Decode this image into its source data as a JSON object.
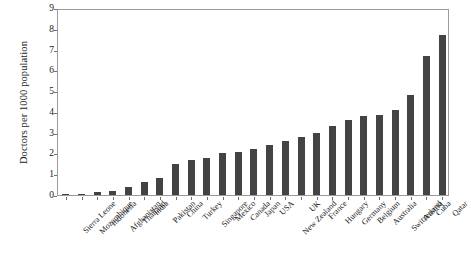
{
  "chart_data": {
    "type": "bar",
    "title": "",
    "xlabel": "",
    "ylabel": "Doctors per 1000 population",
    "ylim": [
      0,
      9
    ],
    "yticks": [
      0,
      1,
      2,
      3,
      4,
      5,
      6,
      7,
      8,
      9
    ],
    "ytick_labels": [
      "0",
      "1",
      "2",
      "3",
      "4",
      "5",
      "6",
      "7",
      "8",
      "9"
    ],
    "grid": false,
    "legend": false,
    "bar_color": "#434343",
    "axis_color": "#9a9a9a",
    "categories": [
      "Sierra Leone",
      "Mozambique",
      "Indonesia",
      "Afghanistan",
      "Thailand",
      "India",
      "Pakistan",
      "China",
      "Turkey",
      "Singapore",
      "Mexico",
      "Canada",
      "Japan",
      "USA",
      "New Zealand",
      "UK",
      "France",
      "Hungary",
      "Germany",
      "Belgium",
      "Australia",
      "Switzerland",
      "Austria",
      "Cuba",
      "Qatar"
    ],
    "values": [
      0.02,
      0.05,
      0.15,
      0.2,
      0.4,
      0.65,
      0.8,
      1.5,
      1.7,
      1.8,
      2.0,
      2.05,
      2.2,
      2.4,
      2.6,
      2.8,
      3.0,
      3.3,
      3.6,
      3.8,
      3.85,
      4.1,
      4.8,
      6.7,
      7.7
    ]
  }
}
